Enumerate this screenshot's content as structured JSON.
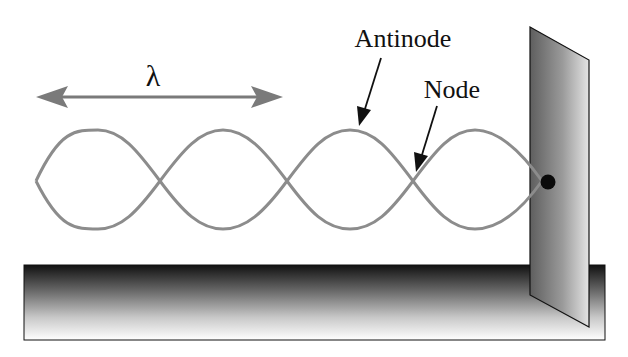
{
  "diagram": {
    "labels": {
      "wavelength": "λ",
      "antinode": "Antinode",
      "node": "Node"
    },
    "colors": {
      "string": "#8c8c8c",
      "arrow_wavelength": "#7a7a7a",
      "annotation_arrow": "#111111",
      "text": "#111111",
      "fixed_point": "#0a0a0a",
      "outline": "#111111"
    },
    "wave": {
      "loops": 4,
      "start_x": 36,
      "end_x": 542,
      "center_y": 181,
      "amplitude": 50
    },
    "icons": [
      "double-headed-arrow-icon",
      "pointer-arrow-icon",
      "fixed-point-dot-icon"
    ]
  }
}
